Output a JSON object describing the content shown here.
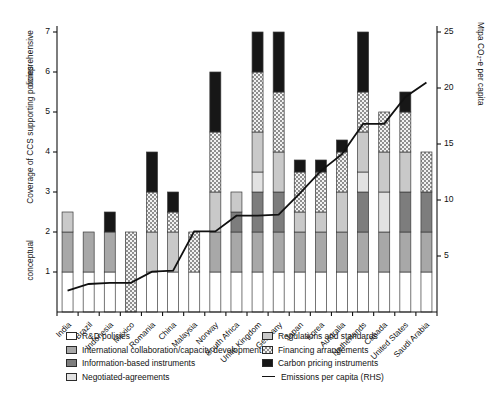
{
  "chart_data": {
    "type": "bar",
    "title": "",
    "subtitle": "",
    "stacked": true,
    "ylabel": "Coverage of CCS supporting policies",
    "ylabel_top": "comprehensive",
    "ylabel_bottom": "conceptual",
    "ylabel_right": "Mtpa CO₂-e per capita",
    "xlabel": "",
    "ylim": [
      0,
      7
    ],
    "yticks": [
      "1",
      "2",
      "3",
      "4",
      "5",
      "6",
      "7"
    ],
    "ylim_right": [
      0,
      25
    ],
    "yticks_right": [
      "5",
      "10",
      "15",
      "20",
      "25"
    ],
    "grid": false,
    "legend_position": "below-axis",
    "categories": [
      "India",
      "Brazil",
      "Indonesia",
      "Mexico",
      "Romania",
      "China",
      "Malaysia",
      "Norway",
      "South Africa",
      "Unite Kingdom",
      "Germany",
      "Japan",
      "Korea",
      "Australia",
      "Netherlands",
      "Canada",
      "United States",
      "Saudi Arabia"
    ],
    "series": [
      {
        "name": "R&D policies",
        "key": "rd",
        "color": "#ffffff",
        "pattern": "solid",
        "values": [
          1.0,
          1.0,
          1.0,
          0.0,
          1.0,
          1.0,
          1.0,
          1.0,
          1.0,
          1.0,
          1.0,
          1.0,
          1.0,
          1.0,
          1.0,
          1.0,
          1.0,
          1.0
        ]
      },
      {
        "name": "International collaboration/capacity development",
        "key": "intl",
        "color": "#a8a8a8",
        "pattern": "solid",
        "values": [
          1.0,
          1.0,
          1.0,
          0.0,
          0.0,
          0.0,
          0.0,
          1.0,
          1.0,
          1.0,
          1.0,
          1.0,
          1.0,
          1.0,
          1.0,
          1.0,
          1.0,
          1.0
        ]
      },
      {
        "name": "Information-based instruments",
        "key": "info",
        "color": "#7d7d7d",
        "pattern": "solid",
        "values": [
          0.0,
          0.0,
          0.0,
          0.0,
          0.0,
          0.0,
          0.0,
          0.0,
          0.5,
          1.0,
          1.0,
          0.0,
          0.0,
          0.0,
          1.0,
          0.0,
          1.0,
          1.0
        ]
      },
      {
        "name": "Negotiated-agreements",
        "key": "nego",
        "color": "#e2e2e2",
        "pattern": "solid",
        "values": [
          0.0,
          0.0,
          0.0,
          0.0,
          0.0,
          0.0,
          0.0,
          0.0,
          0.0,
          0.5,
          0.0,
          0.0,
          0.0,
          0.0,
          0.5,
          1.0,
          0.0,
          0.0
        ]
      },
      {
        "name": "Regulations and standards",
        "key": "reg",
        "color": "#c9c9c9",
        "pattern": "solid",
        "values": [
          0.5,
          0.0,
          0.0,
          0.0,
          1.0,
          1.0,
          0.0,
          1.0,
          0.5,
          1.0,
          1.0,
          0.5,
          0.5,
          1.0,
          1.0,
          1.0,
          1.0,
          0.0
        ]
      },
      {
        "name": "Financing arrangements",
        "key": "fin",
        "color": "#bdbdbd",
        "pattern": "checker",
        "values": [
          0.0,
          0.0,
          0.0,
          2.0,
          1.0,
          0.5,
          1.0,
          1.5,
          0.0,
          1.5,
          1.5,
          1.0,
          1.0,
          1.0,
          1.0,
          1.0,
          1.0,
          1.0
        ]
      },
      {
        "name": "Carbon pricing instruments",
        "key": "carbon",
        "color": "#171717",
        "pattern": "solid",
        "values": [
          0.0,
          0.0,
          0.5,
          0.0,
          1.0,
          0.5,
          0.0,
          1.5,
          0.0,
          1.0,
          1.5,
          0.3,
          0.3,
          0.3,
          1.5,
          0.0,
          0.5,
          0.0
        ]
      }
    ],
    "bar_totals": [
      2.5,
      2.0,
      2.5,
      2.0,
      5.0,
      3.5,
      3.0,
      6.0,
      3.0,
      6.0,
      6.0,
      4.3,
      4.0,
      4.3,
      6.0,
      5.0,
      5.5,
      3.1
    ],
    "line_series": {
      "name": "Emissions per capita (RHS)",
      "color": "#111111",
      "axis": "right",
      "units": "Mtpa CO2-e per capita",
      "values": [
        1.9,
        2.5,
        2.6,
        2.6,
        3.6,
        3.7,
        7.2,
        7.2,
        8.6,
        8.6,
        8.7,
        10.6,
        12.6,
        14.1,
        16.8,
        16.8,
        19.2,
        20.5
      ]
    }
  },
  "axes": {
    "left_title": "Coverage of CCS supporting policies",
    "left_top_anchor": "comprehensive",
    "left_bottom_anchor": "conceptual",
    "right_title": "Mtpa CO₂-e per capita"
  },
  "legend": {
    "left_column": [
      {
        "label": "R&D policies",
        "swatch": "sw-rd",
        "icon": "swatch-white-icon"
      },
      {
        "label": "International collaboration/capacity development",
        "swatch": "sw-intl",
        "icon": "swatch-grey-icon"
      },
      {
        "label": "Information-based instruments",
        "swatch": "sw-info",
        "icon": "swatch-darkgrey-icon"
      },
      {
        "label": "Negotiated-agreements",
        "swatch": "sw-nego",
        "icon": "swatch-lightgrey-icon"
      }
    ],
    "right_column": [
      {
        "label": "Regulations and standards",
        "swatch": "sw-reg",
        "icon": "swatch-midgrey-icon"
      },
      {
        "label": "Financing arrangements",
        "swatch": "sw-fin",
        "icon": "swatch-checker-icon"
      },
      {
        "label": "Carbon pricing instruments",
        "swatch": "sw-carbon",
        "icon": "swatch-black-icon"
      },
      {
        "label": "Emissions per capita (RHS)",
        "swatch": "line",
        "icon": "line-sample-icon"
      }
    ]
  }
}
